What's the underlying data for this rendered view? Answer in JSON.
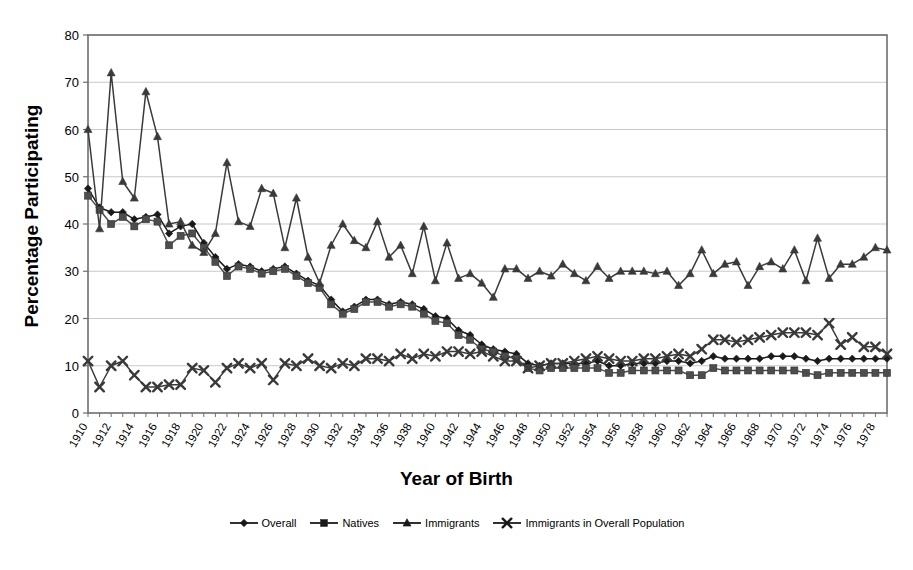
{
  "chart_data": {
    "type": "line",
    "title": "",
    "xlabel": "Year of Birth",
    "ylabel": "Percentage Participating",
    "xlim": [
      1910,
      1979
    ],
    "ylim": [
      0,
      80
    ],
    "ytick_step": 10,
    "yticks": [
      0,
      10,
      20,
      30,
      40,
      50,
      60,
      70,
      80
    ],
    "xtick_step": 1,
    "xlabel_step": 2,
    "grid": "horizontal",
    "legend_position": "bottom",
    "x": [
      1910,
      1911,
      1912,
      1913,
      1914,
      1915,
      1916,
      1917,
      1918,
      1919,
      1920,
      1921,
      1922,
      1923,
      1924,
      1925,
      1926,
      1927,
      1928,
      1929,
      1930,
      1931,
      1932,
      1933,
      1934,
      1935,
      1936,
      1937,
      1938,
      1939,
      1940,
      1941,
      1942,
      1943,
      1944,
      1945,
      1946,
      1947,
      1948,
      1949,
      1950,
      1951,
      1952,
      1953,
      1954,
      1955,
      1956,
      1957,
      1958,
      1959,
      1960,
      1961,
      1962,
      1963,
      1964,
      1965,
      1966,
      1967,
      1968,
      1969,
      1970,
      1971,
      1972,
      1973,
      1974,
      1975,
      1976,
      1977,
      1978,
      1979
    ],
    "xtick_labels": [
      "1910",
      "1912",
      "1914",
      "1916",
      "1918",
      "1920",
      "1922",
      "1924",
      "1926",
      "1928",
      "1930",
      "1932",
      "1934",
      "1936",
      "1938",
      "1940",
      "1942",
      "1944",
      "1946",
      "1948",
      "1950",
      "1952",
      "1954",
      "1956",
      "1958",
      "1960",
      "1962",
      "1964",
      "1966",
      "1968",
      "1970",
      "1972",
      "1974",
      "1976",
      "1978"
    ],
    "series": [
      {
        "name": "Overall",
        "marker": "diamond",
        "color": "#1a1a1a",
        "values": [
          47.5,
          43.5,
          42.5,
          42.5,
          41.0,
          41.5,
          42.0,
          38.0,
          39.5,
          40.0,
          36.0,
          33.0,
          30.5,
          31.5,
          31.0,
          30.0,
          30.5,
          31.0,
          29.5,
          28.0,
          27.0,
          24.0,
          21.5,
          22.5,
          24.0,
          24.0,
          23.0,
          23.5,
          23.0,
          22.0,
          20.5,
          20.0,
          17.5,
          16.5,
          14.5,
          13.5,
          13.0,
          12.5,
          10.5,
          10.0,
          10.5,
          10.5,
          10.5,
          10.5,
          11.0,
          10.0,
          10.0,
          10.5,
          10.5,
          10.5,
          11.0,
          11.0,
          10.5,
          11.0,
          12.0,
          11.5,
          11.5,
          11.5,
          11.5,
          12.0,
          12.0,
          12.0,
          11.5,
          11.0,
          11.5,
          11.5,
          11.5,
          11.5,
          11.5,
          11.5
        ]
      },
      {
        "name": "Natives",
        "marker": "square",
        "color": "#4d4d4d",
        "values": [
          46.0,
          43.0,
          40.0,
          41.5,
          39.5,
          41.0,
          40.5,
          35.5,
          37.5,
          38.0,
          35.0,
          32.0,
          29.0,
          31.0,
          30.5,
          29.5,
          30.0,
          30.5,
          29.0,
          27.5,
          26.5,
          23.0,
          21.0,
          22.0,
          23.5,
          23.5,
          22.5,
          23.0,
          22.5,
          21.0,
          19.5,
          19.0,
          16.5,
          15.5,
          13.5,
          13.0,
          12.0,
          11.5,
          9.5,
          9.0,
          9.5,
          9.5,
          9.5,
          9.5,
          9.5,
          8.5,
          8.5,
          9.0,
          9.0,
          9.0,
          9.0,
          9.0,
          8.0,
          8.0,
          9.5,
          9.0,
          9.0,
          9.0,
          9.0,
          9.0,
          9.0,
          9.0,
          8.5,
          8.0,
          8.5,
          8.5,
          8.5,
          8.5,
          8.5,
          8.5
        ]
      },
      {
        "name": "Immigrants",
        "marker": "triangle",
        "color": "#3a3a3a",
        "values": [
          60.0,
          39.0,
          72.0,
          49.0,
          45.5,
          68.0,
          58.5,
          40.0,
          40.5,
          35.5,
          34.0,
          38.0,
          53.0,
          40.5,
          39.5,
          47.5,
          46.5,
          35.0,
          45.5,
          33.0,
          27.5,
          35.5,
          40.0,
          36.5,
          35.0,
          40.5,
          33.0,
          35.5,
          29.5,
          39.5,
          28.0,
          36.0,
          28.5,
          29.5,
          27.5,
          24.5,
          30.5,
          30.5,
          28.5,
          30.0,
          29.0,
          31.5,
          29.5,
          28.0,
          31.0,
          28.5,
          30.0,
          30.0,
          30.0,
          29.5,
          30.0,
          27.0,
          29.5,
          34.5,
          29.5,
          31.5,
          32.0,
          27.0,
          31.0,
          32.0,
          30.5,
          34.5,
          28.0,
          37.0,
          28.5,
          31.5,
          31.5,
          33.0,
          35.0,
          34.5
        ]
      },
      {
        "name": "Immigrants in Overall Population",
        "marker": "star",
        "color": "#3a3a3a",
        "values": [
          11.0,
          5.5,
          10.0,
          11.0,
          8.0,
          5.5,
          5.5,
          6.0,
          6.0,
          9.5,
          9.0,
          6.5,
          9.5,
          10.5,
          9.5,
          10.5,
          7.0,
          10.5,
          10.0,
          11.5,
          10.0,
          9.5,
          10.5,
          10.0,
          11.5,
          11.5,
          11.0,
          12.5,
          11.5,
          12.5,
          12.0,
          13.0,
          13.0,
          12.5,
          13.0,
          12.0,
          11.0,
          11.0,
          9.5,
          10.0,
          10.5,
          10.5,
          11.0,
          11.5,
          12.0,
          11.5,
          11.0,
          11.0,
          11.5,
          11.5,
          12.0,
          12.5,
          12.0,
          13.5,
          15.5,
          15.5,
          15.0,
          15.5,
          16.0,
          16.5,
          17.0,
          17.0,
          17.0,
          16.5,
          19.0,
          14.5,
          16.0,
          14.0,
          14.0,
          12.5
        ]
      }
    ]
  },
  "legend": {
    "items": [
      {
        "label": "Overall",
        "marker": "diamond"
      },
      {
        "label": "Natives",
        "marker": "square"
      },
      {
        "label": "Immigrants",
        "marker": "triangle"
      },
      {
        "label": "Immigrants in Overall Population",
        "marker": "star"
      }
    ]
  },
  "style": {
    "plot_bg": "#ffffff",
    "frame_color": "#6e6e6e",
    "grid_color": "#c9c9c9",
    "text_color": "#000000"
  }
}
